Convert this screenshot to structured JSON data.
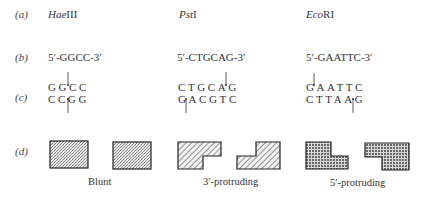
{
  "row_labels": {
    "a": "(a)",
    "b": "(b)",
    "c": "(c)",
    "d": "(d)"
  },
  "enzymes": [
    {
      "italic": "Hae",
      "roman": "III",
      "site": "5′-GGCC-3′",
      "top_strand": "GGCC",
      "bottom_strand": "CCGG",
      "end_type": "Blunt"
    },
    {
      "italic": "Pst",
      "roman": "I",
      "site": "5′-CTGCAG-3′",
      "top_strand": "CTGCAG",
      "bottom_strand": "GACGTC",
      "end_type": "3′-protruding"
    },
    {
      "italic": "Eco",
      "roman": "RI",
      "site": "5′-GAATTC-3′",
      "top_strand": "GAATTC",
      "bottom_strand": "CTTAAG",
      "end_type": "5′-protruding"
    }
  ],
  "colors": {
    "ink": "#333333",
    "outline": "#222222",
    "fill": "#bdbdbd"
  }
}
